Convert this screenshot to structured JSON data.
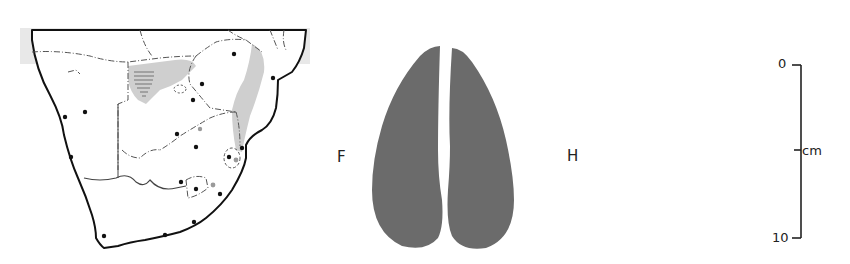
{
  "map": {
    "region": "Southern Africa",
    "colors": {
      "land": "#ffffff",
      "outside": "#e6e6e6",
      "coast": "#111111",
      "border": "#555555",
      "range": "#cfcfcf",
      "hatch": "#888888",
      "dot": "#111111",
      "grey_dot": "#9a9a9a"
    },
    "legend_symbols": [
      "range-shading",
      "hatched-area",
      "locality-dot",
      "dashed-outline"
    ]
  },
  "prints": {
    "front": {
      "label": "F"
    },
    "hind": {
      "label": "H"
    },
    "fill_color": "#6b6b6b"
  },
  "scale": {
    "top_label": "0",
    "mid_label": "cm",
    "bottom_label": "10"
  }
}
